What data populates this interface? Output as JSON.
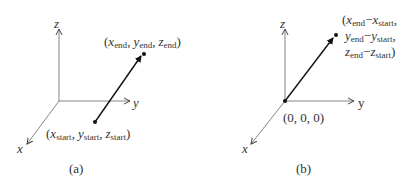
{
  "panels": [
    {
      "id": "a",
      "caption": "(a)",
      "axes": {
        "x_label": "x",
        "y_label": "y",
        "z_label": "z"
      },
      "start_point": {
        "label_parts": [
          "x",
          "start",
          "y",
          "start",
          "z",
          "start"
        ]
      },
      "end_point": {
        "label_parts": [
          "x",
          "end",
          "y",
          "end",
          "z",
          "end"
        ]
      }
    },
    {
      "id": "b",
      "caption": "(b)",
      "axes": {
        "x_label": "x",
        "y_label": "y",
        "z_label": "z"
      },
      "origin_label": "(0, 0, 0)",
      "end_point": {
        "line1": [
          "x",
          "end",
          "x",
          "start"
        ],
        "line2": [
          "y",
          "end",
          "y",
          "start"
        ],
        "line3": [
          "z",
          "end",
          "z",
          "start"
        ]
      }
    }
  ],
  "text": {
    "open": "(",
    "close": ")",
    "comma": ",",
    "minus": "−",
    "x": "x",
    "y": "y",
    "z": "z",
    "start": "start",
    "end": "end",
    "cap_a": "(a)",
    "cap_b": "(b)",
    "origin": "(0, 0, 0)"
  }
}
